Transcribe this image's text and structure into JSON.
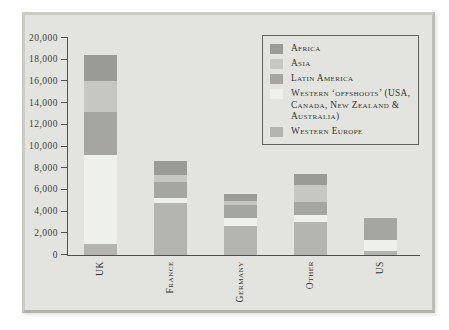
{
  "panel": {
    "background": "#e3e4df",
    "border_color": "#c0c1bb"
  },
  "chart_data": {
    "type": "bar",
    "subtype": "stacked",
    "categories": [
      "UK",
      "France",
      "Germany",
      "Other",
      "US"
    ],
    "series": [
      {
        "name": "Western Europe",
        "color": "#b4b5b0",
        "values": [
          1000,
          4800,
          2700,
          3050,
          400
        ]
      },
      {
        "name": "Western ‘offshoots’ (USA, Canada, New Zealand & Australia)",
        "color": "#eef0ea",
        "values": [
          8250,
          500,
          700,
          600,
          1000
        ]
      },
      {
        "name": "Latin America",
        "color": "#a5a6a1",
        "values": [
          3950,
          1400,
          1200,
          1250,
          2000
        ]
      },
      {
        "name": "Asia",
        "color": "#c6c7c2",
        "values": [
          2800,
          700,
          350,
          1550,
          0
        ]
      },
      {
        "name": "Africa",
        "color": "#9a9a97",
        "values": [
          2430,
          1300,
          650,
          1050,
          0
        ]
      }
    ],
    "totals": {
      "UK": 18430,
      "France": 8700,
      "Germany": 5600,
      "Other": 7500,
      "US": 3400
    },
    "xlabel": "",
    "ylabel": "",
    "ylim": [
      0,
      20000
    ],
    "ytick_step": 2000,
    "yticks": [
      "0",
      "2,000",
      "4,000",
      "6,000",
      "8,000",
      "10,000",
      "12,000",
      "14,000",
      "16,000",
      "18,000",
      "20,000"
    ],
    "grid": false,
    "legend": {
      "position": "top-right",
      "entries": [
        {
          "label": "Africa",
          "color": "#9a9a97"
        },
        {
          "label": "Asia",
          "color": "#c6c7c2"
        },
        {
          "label": "Latin America",
          "color": "#a5a6a1"
        },
        {
          "label": "Western ‘offshoots’ (USA, Canada, New Zealand & Australia)",
          "color": "#eef0ea"
        },
        {
          "label": "Western Europe",
          "color": "#b4b5b0"
        }
      ]
    },
    "axis_color": "#50504a",
    "text_color": "#35352f"
  }
}
